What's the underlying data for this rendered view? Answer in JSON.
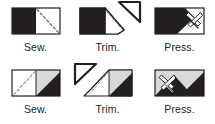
{
  "page": {
    "background_color": "#ffffff",
    "text_color": "#231f20",
    "dark_fabric_color": "#231f20",
    "light_fabric_color": "#ffffff",
    "grey_fabric_color": "#d9d9d9",
    "outline_color": "#231f20",
    "stitch_line_color": "#8c8c8c"
  },
  "rows": [
    {
      "name": "top-row",
      "steps": [
        {
          "label": "Sew.",
          "icon": "sew-unit-dark-left-icon",
          "description": "Rectangle unit: dark square on left, light square on right, dashed stitching line across the light square"
        },
        {
          "label": "Trim.",
          "icon": "trim-unit-dark-left-icon",
          "description": "Unit with corner cut on the diagonal; trimmed triangle flying off to the upper right"
        },
        {
          "label": "Press.",
          "icon": "press-unit-dark-left-icon",
          "description": "Dark unit with light triangle pressed open and an iron pressing it"
        }
      ]
    },
    {
      "name": "bottom-row",
      "steps": [
        {
          "label": "Sew.",
          "icon": "sew-unit-light-left-icon",
          "description": "Rectangle unit: light square on left, grey square with dark triangle on right, dashed stitching line rising to the right"
        },
        {
          "label": "Trim.",
          "icon": "trim-unit-light-left-icon",
          "description": "Unit with corner cut on the diagonal; trimmed triangle flying off to the upper left"
        },
        {
          "label": "Press.",
          "icon": "press-unit-light-left-icon",
          "description": "Light unit with dark triangles pressed open and an iron pressing it"
        }
      ]
    }
  ]
}
